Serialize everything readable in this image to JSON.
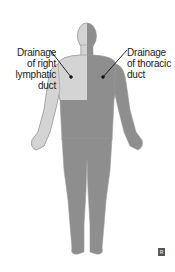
{
  "labels": {
    "right_lymphatic": [
      "Drainage",
      "of right",
      "lymphatic",
      "duct"
    ],
    "thoracic": [
      "Drainage",
      "of thoracic",
      "duct"
    ]
  },
  "logo": {
    "text": "R"
  },
  "colors": {
    "light_region": "#d4d4d4",
    "dark_region": "#8e8e8e",
    "outline": "#9a9a9a",
    "leader": "#111111"
  }
}
